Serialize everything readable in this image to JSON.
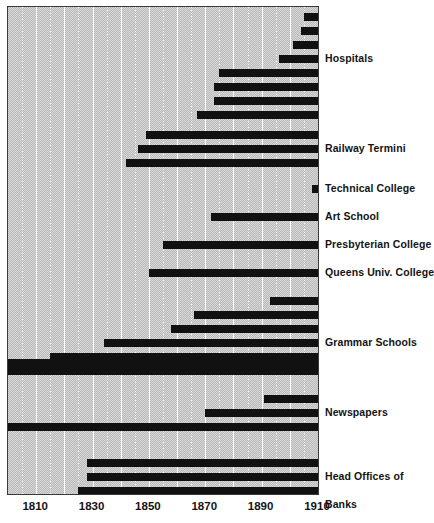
{
  "chart_data": {
    "type": "bar",
    "title": "",
    "subtitle": "",
    "xlabel": "",
    "ylabel": "",
    "xlim": [
      1800,
      1910
    ],
    "grid": true,
    "grid_interval": 10,
    "legend_position": "right-inline",
    "orientation": "horizontal",
    "bar_meaning": "foundation year to 1910 (bar spans from founding date to right edge of chart)",
    "xticks": [
      1810,
      1830,
      1850,
      1870,
      1890,
      1910
    ],
    "xticklabels": [
      "1810",
      "1830",
      "1850",
      "1870",
      "1890",
      "1910"
    ],
    "groups": [
      {
        "name": "Hospitals",
        "label": "Hospitals",
        "label_row": 4,
        "bars": [
          {
            "start": 1905,
            "end": 1910
          },
          {
            "start": 1904,
            "end": 1910
          },
          {
            "start": 1901,
            "end": 1910
          },
          {
            "start": 1896,
            "end": 1910
          },
          {
            "start": 1875,
            "end": 1910
          },
          {
            "start": 1873,
            "end": 1910
          },
          {
            "start": 1873,
            "end": 1910
          },
          {
            "start": 1867,
            "end": 1910
          }
        ]
      },
      {
        "name": "Railway Termini",
        "label": "Railway Termini",
        "label_row": 2,
        "bars": [
          {
            "start": 1849,
            "end": 1910
          },
          {
            "start": 1846,
            "end": 1910
          },
          {
            "start": 1842,
            "end": 1910
          }
        ]
      },
      {
        "name": "Technical College",
        "label": "Technical College",
        "label_row": 1,
        "bars": [
          {
            "start": 1908,
            "end": 1910
          }
        ]
      },
      {
        "name": "Art School",
        "label": "Art School",
        "label_row": 1,
        "bars": [
          {
            "start": 1872,
            "end": 1910
          }
        ]
      },
      {
        "name": "Presbyterian College",
        "label": "Presbyterian College",
        "label_row": 1,
        "bars": [
          {
            "start": 1855,
            "end": 1910
          }
        ]
      },
      {
        "name": "Queens Univ. College",
        "label": "Queens Univ. College",
        "label_row": 1,
        "bars": [
          {
            "start": 1850,
            "end": 1910
          }
        ]
      },
      {
        "name": "Grammar Schools",
        "label": "Grammar Schools",
        "label_row": 4,
        "bars": [
          {
            "start": 1893,
            "end": 1910
          },
          {
            "start": 1866,
            "end": 1910
          },
          {
            "start": 1858,
            "end": 1910
          },
          {
            "start": 1834,
            "end": 1910
          },
          {
            "start": 1815,
            "end": 1910
          },
          {
            "start": 1800,
            "end": 1910
          }
        ]
      },
      {
        "name": "Newspapers",
        "label": "Newspapers",
        "label_row": 2,
        "bars": [
          {
            "start": 1891,
            "end": 1910
          },
          {
            "start": 1870,
            "end": 1910
          },
          {
            "start": 1826,
            "end": 1910
          }
        ]
      },
      {
        "name": "Head Offices of Banks",
        "label": "Head Offices of",
        "label2": "Banks",
        "label_row": 2,
        "bars": [
          {
            "start": 1828,
            "end": 1910
          },
          {
            "start": 1828,
            "end": 1910
          },
          {
            "start": 1825,
            "end": 1910
          }
        ]
      }
    ]
  },
  "labels": {
    "hospitals": "Hospitals",
    "railway_termini": "Railway Termini",
    "technical_college": "Technical College",
    "art_school": "Art School",
    "presbyterian_college": "Presbyterian College",
    "queens_univ_college": "Queens Univ. College",
    "grammar_schools": "Grammar Schools",
    "newspapers": "Newspapers",
    "head_offices_of": "Head Offices of",
    "banks": "Banks"
  },
  "axis": {
    "ticks": [
      "1810",
      "1830",
      "1850",
      "1870",
      "1890",
      "1910"
    ]
  },
  "colors": {
    "bar": "#111111",
    "plot_background": "#c9c9c9",
    "gridline": "#ffffff",
    "border": "#3a3a3a",
    "text": "#141414"
  }
}
